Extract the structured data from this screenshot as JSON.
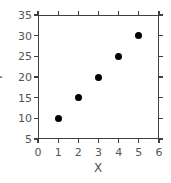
{
  "chart_data": {
    "type": "scatter",
    "title": "",
    "xlabel": "X",
    "ylabel": "Y",
    "xlim": [
      0,
      6
    ],
    "ylim": [
      5,
      35
    ],
    "xticks": [
      0,
      1,
      2,
      3,
      4,
      5,
      6
    ],
    "yticks": [
      5,
      10,
      15,
      20,
      25,
      30,
      35
    ],
    "xticklabels": [
      "0",
      "1",
      "2",
      "3",
      "4",
      "5",
      "6"
    ],
    "yticklabels": [
      "5",
      "10",
      "15",
      "20",
      "25",
      "30",
      "35"
    ],
    "grid": false,
    "legend": null,
    "marker": "filled-circle",
    "marker_color": "#000000",
    "axis_color": "#3f3f3f",
    "label_color": "#555555",
    "background": "#ffffff",
    "ticks_direction": "out",
    "ticks_on_all_spines": true,
    "series": [
      {
        "name": "data",
        "x": [
          1,
          2,
          3,
          4,
          5
        ],
        "y": [
          10,
          15,
          20,
          25,
          30
        ],
        "points": [
          {
            "x": 1,
            "y": 10
          },
          {
            "x": 2,
            "y": 15
          },
          {
            "x": 3,
            "y": 20
          },
          {
            "x": 4,
            "y": 25
          },
          {
            "x": 5,
            "y": 30
          }
        ]
      }
    ]
  }
}
